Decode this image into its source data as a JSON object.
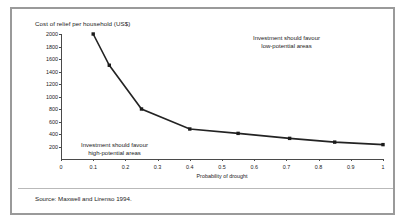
{
  "figure": {
    "title": "Cost of relief per household (US$)",
    "source": "Source: Maxwell and Lirenso 1994."
  },
  "annotations": {
    "low_potential_line1": "Investment should favour",
    "low_potential_line2": "low-potential areas",
    "high_potential_line1": "Investment should favour",
    "high_potential_line2": "high-potential areas"
  },
  "chart_data": {
    "type": "line",
    "title": "Cost of relief per household (US$)",
    "xlabel": "Probability of drought",
    "ylabel": "Cost of relief per household (US$)",
    "xlim": [
      0,
      1
    ],
    "ylim": [
      0,
      2000
    ],
    "grid": false,
    "legend": "none",
    "xticks": [
      "0",
      "0.1",
      "0.2",
      "0.3",
      "0.4",
      "0.5",
      "0.6",
      "0.7",
      "0.8",
      "0.9",
      "1"
    ],
    "xtick_values": [
      0,
      0.1,
      0.2,
      0.3,
      0.4,
      0.5,
      0.6,
      0.7,
      0.8,
      0.9,
      1
    ],
    "yticks": [
      "200",
      "400",
      "600",
      "800",
      "1000",
      "1200",
      "1400",
      "1600",
      "1800",
      "2000"
    ],
    "ytick_values": [
      200,
      400,
      600,
      800,
      1000,
      1200,
      1400,
      1600,
      1800,
      2000
    ],
    "series": [
      {
        "name": "Cost of relief per household",
        "x": [
          0.1,
          0.15,
          0.25,
          0.4,
          0.55,
          0.71,
          0.85,
          1.0
        ],
        "values": [
          2000,
          1500,
          800,
          480,
          410,
          330,
          270,
          230
        ],
        "color": "#232323",
        "marker": "square"
      }
    ],
    "annotations": [
      {
        "text": "Investment should favour low-potential areas",
        "x": 0.72,
        "y": 1900
      },
      {
        "text": "Investment should favour high-potential areas",
        "x": 0.27,
        "y": 350
      }
    ]
  }
}
